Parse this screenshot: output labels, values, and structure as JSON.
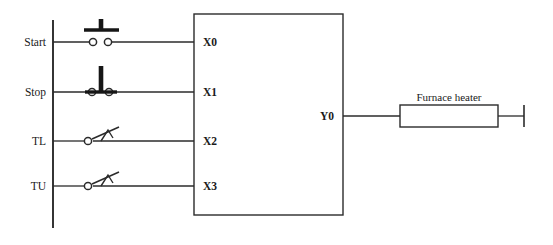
{
  "diagram": {
    "type": "plc-wiring-diagram",
    "title": "",
    "colors": {
      "background": "#ffffff",
      "line": "#2b2b2b",
      "symbol_fill": "#161616",
      "text": "#1a1a1a"
    },
    "power_rail": {
      "name": "left-power-rail",
      "x": 53,
      "y_top": 20,
      "y_bottom": 228
    },
    "controller": {
      "name": "plc-unit",
      "label": "",
      "x": 194,
      "y": 14,
      "width": 149,
      "height": 201
    },
    "inputs": [
      {
        "label": "Start",
        "terminal": "X0",
        "device": "normally-open-pushbutton",
        "device_name": "start-pushbutton-no",
        "row_y": 42
      },
      {
        "label": "Stop",
        "terminal": "X1",
        "device": "normally-closed-pushbutton",
        "device_name": "stop-pushbutton-nc",
        "row_y": 92
      },
      {
        "label": "TL",
        "terminal": "X2",
        "device": "temperature-switch-no",
        "device_name": "temperature-low-switch",
        "row_y": 141
      },
      {
        "label": "TU",
        "terminal": "X3",
        "device": "temperature-switch-no",
        "device_name": "temperature-upper-switch",
        "row_y": 186
      }
    ],
    "outputs": [
      {
        "terminal": "Y0",
        "load_label": "Furnace heater",
        "load_name": "furnace-heater-load",
        "row_y": 116,
        "load_x": 400,
        "load_width": 98,
        "load_height": 22,
        "terminal_tick_x": 524
      }
    ]
  }
}
